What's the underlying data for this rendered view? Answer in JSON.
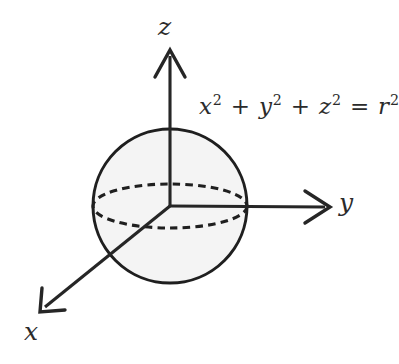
{
  "figure": {
    "kind": "3d-coordinate-sphere-diagram",
    "background_color": "#ffffff",
    "stroke_color": "#262626",
    "sphere_fill_color": "#f4f4f4",
    "width": 399,
    "height": 364
  },
  "axes": {
    "z": {
      "label": "z",
      "direction": "up",
      "tip": [
        170,
        50
      ],
      "origin": [
        170,
        206
      ]
    },
    "y": {
      "label": "y",
      "direction": "right",
      "tip": [
        330,
        207
      ],
      "origin": [
        170,
        206
      ]
    },
    "x": {
      "label": "x",
      "direction": "down-left",
      "tip": [
        40,
        312
      ],
      "origin": [
        170,
        206
      ]
    }
  },
  "sphere": {
    "center": [
      170,
      206
    ],
    "radius": 77,
    "equator": {
      "style": "dashed",
      "rx": 77,
      "ry": 22
    }
  },
  "equation": {
    "text": "x² + y² + z² = r²",
    "terms": [
      {
        "var": "x",
        "exp": "2"
      },
      {
        "var": "y",
        "exp": "2"
      },
      {
        "var": "z",
        "exp": "2"
      }
    ],
    "plus": "+",
    "equals": "=",
    "rhs": {
      "var": "r",
      "exp": "2"
    }
  }
}
